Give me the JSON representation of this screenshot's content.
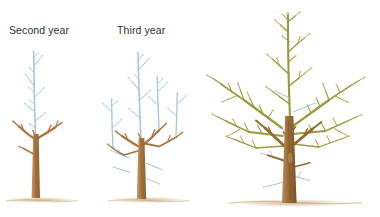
{
  "figure": {
    "background_color": "#ffffff",
    "width": 380,
    "height": 217
  },
  "labels": {
    "second_year": "Second year",
    "third_year": "Third year"
  },
  "palette": {
    "text": "#2f2f31",
    "trunk_brown": "#a8763f",
    "trunk_brown_dark": "#8d5f2c",
    "branch_tan": "#b58a52",
    "new_growth_blue": "#9fc4dc",
    "new_growth_blue_light": "#bcd8e8",
    "canopy_olive": "#9a9a3c",
    "canopy_olive_light": "#b5b45a",
    "bud_pale": "#d9d79a",
    "ground_tan": "#cbb489",
    "background": "#ffffff"
  },
  "trees": [
    {
      "id": "tree-second-year",
      "label": "Second year",
      "stage": "second",
      "canopy_color": "new_growth_blue",
      "trunk_color": "trunk_brown",
      "description": "Young tree with short brown trunk, few scaffold branches and tall blue new-growth leader"
    },
    {
      "id": "tree-third-year",
      "label": "Third year",
      "stage": "third",
      "canopy_color": "new_growth_blue",
      "trunk_color": "trunk_brown",
      "description": "Taller tree with more brown scaffold branches topped by blue new growth"
    },
    {
      "id": "tree-mature",
      "label": "",
      "stage": "mature",
      "canopy_color": "canopy_olive",
      "trunk_color": "trunk_brown_dark",
      "description": "Large mature tree with dense olive-green canopy and blue water sprouts on the trunk"
    }
  ],
  "ground": {
    "mounds": 3,
    "color": "#cbb489",
    "description": "Faint tan soil line at the base of each tree"
  }
}
